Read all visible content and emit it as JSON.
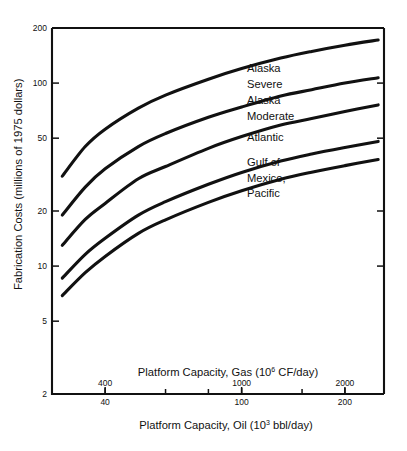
{
  "chart_data": {
    "type": "line",
    "title": "",
    "ylabel": "Fabrication Costs (millions of 1975 dollars)",
    "xlabel_primary": "Platform Capacity, Oil (10³ bbl/day)",
    "xlabel_secondary": "Platform Capacity, Gas (10⁶ CF/day)",
    "xlabel_oil_text": "Platform Capacity, Oil (10",
    "xlabel_oil_exp": "3",
    "xlabel_oil_tail": " bbl/day)",
    "xlabel_gas_text": "Platform Capacity, Gas (10",
    "xlabel_gas_exp": "6",
    "xlabel_gas_tail": " CF/day)",
    "yscale": "log",
    "xscale": "log",
    "ylim": [
      2,
      200
    ],
    "xlim_oil": [
      28,
      260
    ],
    "xlim_gas": [
      280,
      2600
    ],
    "grid": false,
    "legend_position": "inline-labels",
    "ytick_labels": [
      "200",
      "100",
      "50",
      "20",
      "10",
      "5",
      "2"
    ],
    "ytick_values": [
      200,
      100,
      50,
      20,
      10,
      5,
      2
    ],
    "xtick_labels_oil": [
      "40",
      "100",
      "200"
    ],
    "xtick_values_oil": [
      40,
      100,
      200
    ],
    "xtick_labels_gas": [
      "400",
      "1000",
      "2000"
    ],
    "xtick_values_gas": [
      400,
      1000,
      2000
    ],
    "series": [
      {
        "name": "Alaska Severe",
        "label_line1": "Alaska",
        "label_line2": "Severe",
        "x": [
          30,
          35,
          40,
          50,
          60,
          80,
          100,
          130,
          160,
          200,
          250
        ],
        "values": [
          31,
          45,
          56,
          73,
          86,
          105,
          120,
          137,
          149,
          161,
          172
        ]
      },
      {
        "name": "Alaska Moderate",
        "label_line1": "Alaska",
        "label_line2": "Moderate",
        "x": [
          30,
          35,
          40,
          50,
          60,
          80,
          100,
          130,
          160,
          200,
          250
        ],
        "values": [
          19,
          27,
          34,
          45,
          53,
          65,
          74,
          85,
          92,
          100,
          107
        ]
      },
      {
        "name": "Atlantic",
        "label_line1": "Atlantic",
        "label_line2": "",
        "x": [
          30,
          35,
          40,
          50,
          60,
          80,
          100,
          130,
          160,
          200,
          250
        ],
        "values": [
          13,
          18,
          22,
          30,
          35,
          44,
          51,
          59,
          64,
          70,
          76
        ]
      },
      {
        "name": "Gulf of Mexico",
        "label_line1": "Gulf of",
        "label_line2": "Mexico,",
        "x": [
          30,
          35,
          40,
          50,
          60,
          80,
          100,
          130,
          160,
          200,
          250
        ],
        "values": [
          8.6,
          11.6,
          14.2,
          19.0,
          22.5,
          28.0,
          32.5,
          37.5,
          41.0,
          44.5,
          48.0
        ]
      },
      {
        "name": "Pacific",
        "label_line1": "Pacific",
        "label_line2": "",
        "x": [
          30,
          35,
          40,
          50,
          60,
          80,
          100,
          130,
          160,
          200,
          250
        ],
        "values": [
          6.9,
          9.2,
          11.3,
          15.1,
          17.9,
          22.3,
          25.8,
          29.8,
          32.6,
          35.4,
          38.2
        ]
      }
    ]
  },
  "figure": {
    "background_color": "#ffffff",
    "line_color": "#111111"
  }
}
